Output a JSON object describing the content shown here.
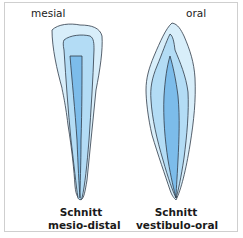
{
  "diagram": {
    "left_tooth": {
      "top_label": "mesial",
      "caption_line1": "Schnitt",
      "caption_line2": "mesio-distal"
    },
    "right_tooth": {
      "top_label": "oral",
      "caption_line1": "Schnitt",
      "caption_line2": "vestibulo-oral"
    },
    "colors": {
      "enamel": "#d8eefa",
      "dentin": "#b3dcf5",
      "pulp": "#7cbcea",
      "outline": "#2e3a48",
      "frame": "#cfcfcf"
    }
  }
}
